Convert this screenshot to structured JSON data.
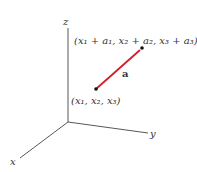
{
  "diagram": {
    "type": "3d-vector-coordinate",
    "axes": {
      "x_label": "x",
      "y_label": "y",
      "z_label": "z"
    },
    "vector": {
      "label": "a",
      "color": "#d0202a"
    },
    "points": {
      "start_label": "(x₁, x₂, x₃)",
      "end_label": "(x₁ + a₁, x₂ + a₂, x₃ + a₃)"
    }
  }
}
